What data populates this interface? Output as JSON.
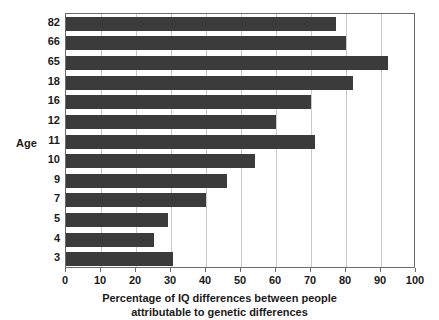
{
  "chart_data": {
    "type": "bar",
    "orientation": "horizontal",
    "title": "",
    "xlabel_line1": "Percentage of IQ differences between people",
    "xlabel_line2": "attributable to genetic differences",
    "ylabel": "Age",
    "categories": [
      "82",
      "66",
      "65",
      "18",
      "16",
      "12",
      "11",
      "10",
      "9",
      "7",
      "5",
      "4",
      "3"
    ],
    "values": [
      77,
      80,
      92,
      82,
      70,
      60,
      71,
      54,
      46,
      40,
      29,
      25,
      30.5
    ],
    "xlim": [
      0,
      100
    ],
    "xticks": [
      0,
      10,
      20,
      30,
      40,
      50,
      60,
      70,
      80,
      90,
      100
    ],
    "xtick_labels": [
      "0",
      "10",
      "20",
      "30",
      "40",
      "50",
      "60",
      "70",
      "80",
      "90",
      "100"
    ],
    "grid": "vertical",
    "legend": "none",
    "bar_color": "#3b3b3b",
    "grid_color": "#c9c9c9",
    "frame_color": "#6b6b6b",
    "background": "#ffffff"
  }
}
